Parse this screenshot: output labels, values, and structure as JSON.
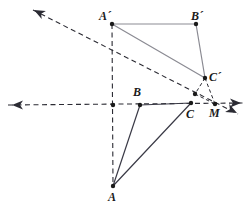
{
  "figure": {
    "type": "geometry-diagram",
    "width": 250,
    "height": 206,
    "background": "#ffffff",
    "colors": {
      "solid_dark": "#3a3a46",
      "solid_light": "#8b8b93",
      "dashed": "#2b2b33",
      "point": "#1a1a1a",
      "label": "#1a1a1a"
    }
  },
  "points": [
    {
      "id": "A",
      "label": "A",
      "x": 113,
      "y": 186,
      "label_x": 108,
      "label_y": 191,
      "dot": true
    },
    {
      "id": "B",
      "label": "B",
      "x": 140,
      "y": 105,
      "label_x": 133,
      "label_y": 86,
      "dot": true
    },
    {
      "id": "C",
      "label": "C",
      "x": 191,
      "y": 103,
      "label_x": 186,
      "label_y": 108,
      "dot": true
    },
    {
      "id": "M",
      "label": "M",
      "x": 215,
      "y": 104,
      "label_x": 209,
      "label_y": 107,
      "dot": true
    },
    {
      "id": "Aprime",
      "label": "A´",
      "x": 112,
      "y": 24,
      "label_x": 99,
      "label_y": 10,
      "dot": true
    },
    {
      "id": "Bprime",
      "label": "B´",
      "x": 196,
      "y": 24,
      "label_x": 191,
      "label_y": 10,
      "dot": true
    },
    {
      "id": "Cprime",
      "label": "C´",
      "x": 205,
      "y": 78,
      "label_x": 209,
      "label_y": 71,
      "dot": true
    },
    {
      "id": "O",
      "label": "",
      "x": 113,
      "y": 105,
      "label_x": 0,
      "label_y": 0,
      "dot": true
    },
    {
      "id": "P",
      "label": "",
      "x": 195,
      "y": 94,
      "label_x": 0,
      "label_y": 0,
      "dot": true
    }
  ],
  "triangles": [
    {
      "name": "triangle-ABC",
      "vertices": [
        "A",
        "B",
        "C"
      ],
      "stroke": "#3a3a46",
      "style": "solid"
    },
    {
      "name": "triangle-ApBpCp",
      "vertices": [
        "Aprime",
        "Bprime",
        "Cprime"
      ],
      "stroke": "#8b8b93",
      "style": "solid"
    }
  ],
  "dashed_segments": [
    {
      "name": "segment-Cprime-M",
      "x1": 205,
      "y1": 78,
      "x2": 215,
      "y2": 104
    },
    {
      "name": "segment-Cprime-P",
      "x1": 205,
      "y1": 78,
      "x2": 195,
      "y2": 94
    },
    {
      "name": "segment-P-M",
      "x1": 195,
      "y1": 94,
      "x2": 215,
      "y2": 104
    }
  ],
  "axes": [
    {
      "name": "horizontal-axis",
      "x1": 8,
      "y1": 105,
      "x2": 243,
      "y2": 103,
      "arrow_start": true,
      "arrow_end": true
    },
    {
      "name": "vertical-axis",
      "x1": 112,
      "y1": 24,
      "x2": 113,
      "y2": 186,
      "arrow_start": false,
      "arrow_end": false
    },
    {
      "name": "diagonal-ray",
      "x1": 33,
      "y1": 10,
      "x2": 238,
      "y2": 114,
      "arrow_start": true,
      "arrow_end": true
    }
  ],
  "arrowheads": [
    {
      "name": "arrow-left",
      "x": 12,
      "y": 105,
      "angle": 180
    },
    {
      "name": "arrow-right",
      "x": 241,
      "y": 103,
      "angle": 0
    },
    {
      "name": "arrow-upper-left",
      "x": 34,
      "y": 10,
      "angle": 207
    },
    {
      "name": "arrow-lower-right",
      "x": 237,
      "y": 113,
      "angle": 27
    }
  ]
}
